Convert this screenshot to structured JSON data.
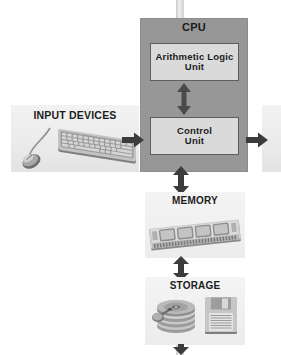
{
  "diagram": {
    "colors": {
      "cpu_fill": "#979797",
      "inner_box_fill": "#dadada",
      "inner_box_border": "#5e5e5e",
      "peripheral_fill": "#ececec",
      "arrow": "#3c3c3c",
      "text": "#1c1c1c"
    },
    "nodes": {
      "cpu": {
        "label": "CPU"
      },
      "alu": {
        "label": "Arithmetic Logic\nUnit"
      },
      "control_unit": {
        "label": "Control\nUnit"
      },
      "input_devices": {
        "label": "INPUT DEVICES",
        "icons": [
          "mouse-icon",
          "keyboard-icon"
        ]
      },
      "output_devices": {
        "label": ""
      },
      "memory": {
        "label": "MEMORY",
        "icons": [
          "ram-module-icon"
        ]
      },
      "storage": {
        "label": "STORAGE",
        "icons": [
          "hard-disk-icon",
          "floppy-disk-icon"
        ]
      }
    },
    "connectors": [
      {
        "name": "input-to-cpu",
        "direction": "right",
        "style": "single"
      },
      {
        "name": "cpu-to-output",
        "direction": "right",
        "style": "single"
      },
      {
        "name": "alu-to-control-unit",
        "direction": "vertical",
        "style": "double"
      },
      {
        "name": "cpu-to-memory",
        "direction": "vertical",
        "style": "double"
      },
      {
        "name": "memory-to-storage",
        "direction": "vertical",
        "style": "double"
      },
      {
        "name": "top-feed-bar",
        "direction": "vertical",
        "style": "bar"
      },
      {
        "name": "bottom-feed-bar",
        "direction": "vertical",
        "style": "bar"
      }
    ]
  }
}
